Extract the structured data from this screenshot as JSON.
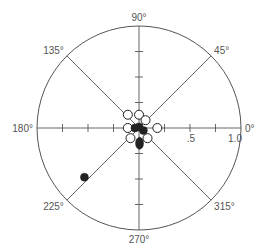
{
  "chart_data": {
    "type": "scatter",
    "subtype": "polar",
    "title": "",
    "center_px": [
      139,
      128
    ],
    "radius_px": 102,
    "rlim": [
      0,
      1.0
    ],
    "r_tick_step": 0.25,
    "r_tick_labels": [
      {
        "value": 0.5,
        "label": ".5"
      },
      {
        "value": 1.0,
        "label": "1.0"
      }
    ],
    "angle_labels": [
      {
        "angle": 0,
        "label": "0°"
      },
      {
        "angle": 45,
        "label": "45°"
      },
      {
        "angle": 90,
        "label": "90°"
      },
      {
        "angle": 135,
        "label": "135°"
      },
      {
        "angle": 180,
        "label": "180°"
      },
      {
        "angle": 225,
        "label": "225°"
      },
      {
        "angle": 270,
        "label": "270°"
      },
      {
        "angle": 315,
        "label": "315°"
      }
    ],
    "grid": "spokes every 45°, ticks every 0.25 on 0/90/180/270 axes",
    "colors": {
      "axis": "#555555",
      "marker": "#222222"
    },
    "series": [
      {
        "name": "open",
        "marker": "open-circle",
        "points": [
          {
            "r": 0.17,
            "theta": 130
          },
          {
            "r": 0.13,
            "theta": 90
          },
          {
            "r": 0.1,
            "theta": 50
          },
          {
            "r": 0.11,
            "theta": 180
          },
          {
            "r": 0.18,
            "theta": 0
          },
          {
            "r": 0.13,
            "theta": 230
          },
          {
            "r": 0.13,
            "theta": 310
          }
        ]
      },
      {
        "name": "filled",
        "marker": "filled-circle",
        "points": [
          {
            "r": 0.04,
            "theta": 180
          },
          {
            "r": 0.01,
            "theta": 90
          },
          {
            "r": 0.05,
            "theta": 330
          },
          {
            "r": 0.72,
            "theta": 222
          }
        ]
      },
      {
        "name": "filled-elongated",
        "marker": "filled-ellipse",
        "points": [
          {
            "r": 0.15,
            "theta": 272
          }
        ]
      }
    ]
  }
}
